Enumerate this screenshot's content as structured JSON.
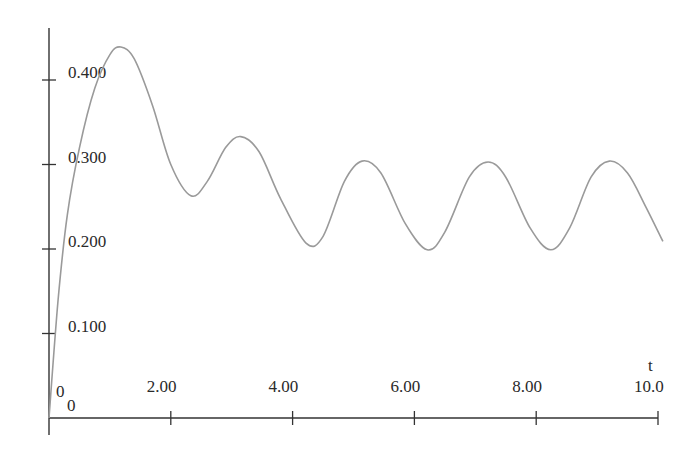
{
  "chart_data": {
    "type": "line",
    "title": "",
    "xlabel": "t",
    "ylabel": "",
    "xlim": [
      0,
      10.0
    ],
    "ylim": [
      0,
      0.46
    ],
    "grid": false,
    "legend": null,
    "origin_labels": {
      "x": "0",
      "y": "0"
    },
    "x_ticks": [
      {
        "value": 2,
        "label": "2.00"
      },
      {
        "value": 4,
        "label": "4.00"
      },
      {
        "value": 6,
        "label": "6.00"
      },
      {
        "value": 8,
        "label": "8.00"
      },
      {
        "value": 10,
        "label": "10.0"
      }
    ],
    "y_ticks": [
      {
        "value": 0.1,
        "label": "0.100"
      },
      {
        "value": 0.2,
        "label": "0.200"
      },
      {
        "value": 0.3,
        "label": "0.300"
      },
      {
        "value": 0.4,
        "label": "0.400"
      }
    ],
    "series": [
      {
        "name": "response",
        "color": "#9a9a9a",
        "x": [
          0,
          0.15,
          0.3,
          0.5,
          0.75,
          1.0,
          1.18,
          1.4,
          1.7,
          2.0,
          2.33,
          2.6,
          2.9,
          3.15,
          3.45,
          3.8,
          4.22,
          4.5,
          4.85,
          5.14,
          5.45,
          5.85,
          6.21,
          6.5,
          6.9,
          7.21,
          7.5,
          7.9,
          8.24,
          8.55,
          8.9,
          9.2,
          9.5,
          9.8,
          10.08
        ],
        "y": [
          0,
          0.14,
          0.24,
          0.32,
          0.39,
          0.43,
          0.439,
          0.425,
          0.37,
          0.3,
          0.263,
          0.28,
          0.32,
          0.333,
          0.315,
          0.26,
          0.207,
          0.215,
          0.28,
          0.304,
          0.29,
          0.23,
          0.199,
          0.22,
          0.285,
          0.303,
          0.285,
          0.225,
          0.199,
          0.225,
          0.285,
          0.304,
          0.29,
          0.25,
          0.209
        ]
      }
    ]
  }
}
